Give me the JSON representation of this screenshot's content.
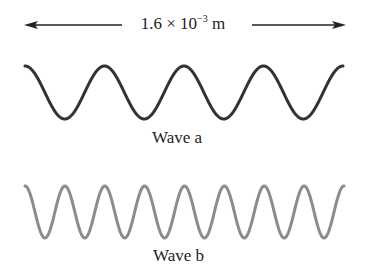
{
  "dimension": {
    "value_text": "1.6 × 10",
    "exponent": "−3",
    "unit": "m"
  },
  "waves": [
    {
      "label": "Wave a",
      "cycles": 4,
      "color": "#333333"
    },
    {
      "label": "Wave b",
      "cycles": 8,
      "color": "#8c8c8c"
    }
  ]
}
